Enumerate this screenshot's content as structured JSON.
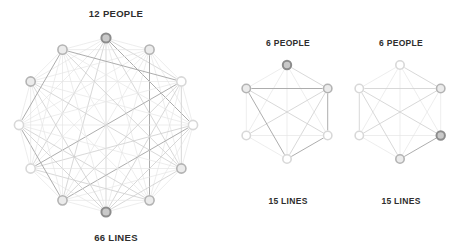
{
  "figure": {
    "background_color": "#ffffff",
    "node_fill": "#ffffff",
    "node_stroke_light": "#d8d8d8",
    "node_stroke_mid": "#b3b3b3",
    "node_stroke_dark": "#8c8c8c",
    "edge_color_light": "#e4e4e4",
    "edge_color_mid": "#cfcfcf",
    "edge_color_dark": "#a9a9a9",
    "text_color": "#2e2e2e"
  },
  "graphs": [
    {
      "id": "graph-12-people",
      "people_label": "12 PEOPLE",
      "lines_label": "66 LINES",
      "nodes": 12,
      "lines": 66,
      "center": {
        "x": 106,
        "y": 125
      },
      "radius": 87,
      "start_angle": -90,
      "node_radius": 4.6,
      "node_shades": [
        "dark",
        "mid",
        "light",
        "light",
        "mid",
        "mid",
        "dark",
        "mid",
        "light",
        "light",
        "mid",
        "mid"
      ],
      "caption_top": {
        "x": 116,
        "y": 8
      },
      "caption_bottom": {
        "x": 116,
        "y": 232
      }
    },
    {
      "id": "graph-6-people-middle",
      "people_label": "6 PEOPLE",
      "lines_label": "15 LINES",
      "nodes": 6,
      "lines": 15,
      "center": {
        "x": 287,
        "y": 112
      },
      "radius": 47,
      "start_angle": -90,
      "node_radius": 4.2,
      "node_shades": [
        "dark",
        "mid",
        "light",
        "light",
        "light",
        "mid"
      ],
      "caption_top": {
        "x": 288,
        "y": 38
      },
      "caption_bottom": {
        "x": 288,
        "y": 196
      }
    },
    {
      "id": "graph-6-people-right",
      "people_label": "6 PEOPLE",
      "lines_label": "15 LINES",
      "nodes": 6,
      "lines": 15,
      "center": {
        "x": 400,
        "y": 112
      },
      "radius": 47,
      "start_angle": -90,
      "node_radius": 4.2,
      "node_shades": [
        "light",
        "mid",
        "dark",
        "mid",
        "light",
        "light"
      ],
      "caption_top": {
        "x": 401,
        "y": 38
      },
      "caption_bottom": {
        "x": 401,
        "y": 196
      }
    }
  ],
  "chart_data": {
    "type": "diagram",
    "title": "",
    "series": [
      {
        "name": "12 PEOPLE",
        "nodes": 12,
        "edges": 66
      },
      {
        "name": "6 PEOPLE",
        "nodes": 6,
        "edges": 15
      },
      {
        "name": "6 PEOPLE",
        "nodes": 6,
        "edges": 15
      }
    ]
  }
}
